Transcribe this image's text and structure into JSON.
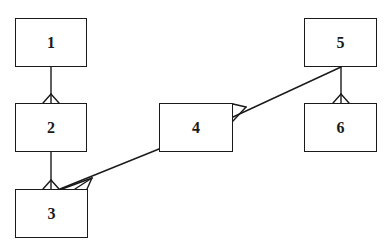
{
  "diagram": {
    "type": "er-diagram",
    "notation": "crows-foot",
    "colors": {
      "stroke": "#1a1a1a",
      "background": "#ffffff"
    },
    "entities": [
      {
        "id": "1",
        "label": "1",
        "x": 15,
        "y": 18,
        "w": 72,
        "h": 49
      },
      {
        "id": "2",
        "label": "2",
        "x": 15,
        "y": 103,
        "w": 72,
        "h": 49
      },
      {
        "id": "3",
        "label": "3",
        "x": 15,
        "y": 189,
        "w": 73,
        "h": 49
      },
      {
        "id": "4",
        "label": "4",
        "x": 159,
        "y": 103,
        "w": 74,
        "h": 49
      },
      {
        "id": "5",
        "label": "5",
        "x": 304,
        "y": 18,
        "w": 73,
        "h": 49
      },
      {
        "id": "6",
        "label": "6",
        "x": 304,
        "y": 103,
        "w": 73,
        "h": 49
      }
    ],
    "relationships": [
      {
        "from": "1",
        "to": "2",
        "cardinality": "one-to-many"
      },
      {
        "from": "2",
        "to": "3",
        "cardinality": "one-to-many"
      },
      {
        "from": "4",
        "to": "3",
        "cardinality": "one-to-many"
      },
      {
        "from": "5",
        "to": "4",
        "cardinality": "one-to-many"
      },
      {
        "from": "5",
        "to": "6",
        "cardinality": "one-to-many"
      }
    ]
  }
}
